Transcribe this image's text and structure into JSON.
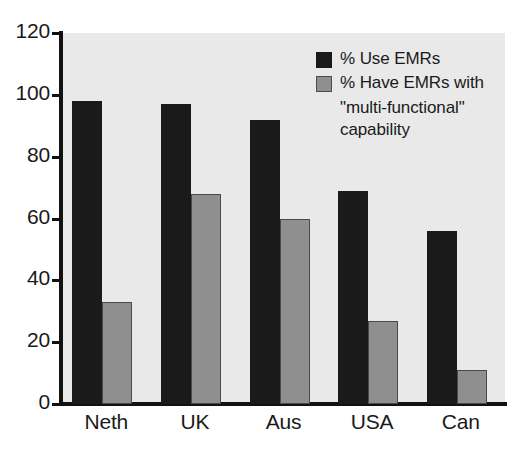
{
  "chart_data": {
    "type": "bar",
    "title": "",
    "subtitle": "",
    "xlabel": "",
    "ylabel": "",
    "categories": [
      "Neth",
      "UK",
      "Aus",
      "USA",
      "Can"
    ],
    "series": [
      {
        "name": "% Use EMRs",
        "color": "#1a1a1a",
        "values": [
          98,
          97,
          92,
          69,
          56
        ]
      },
      {
        "name": "% Have EMRs with \"multi-functional\" capability",
        "color": "#8f8f8f",
        "values": [
          33,
          68,
          60,
          27,
          11
        ]
      }
    ],
    "ylim": [
      0,
      120
    ],
    "yticks": [
      0,
      20,
      40,
      60,
      80,
      100,
      120
    ],
    "ytick_labels": [
      "0",
      "20",
      "40",
      "60",
      "80",
      "100",
      "120"
    ],
    "grid": false,
    "legend_position": "top-right"
  },
  "legend": {
    "entries": [
      {
        "swatch": "black-square",
        "line1": "% Use EMRs",
        "line2": "",
        "line3": ""
      },
      {
        "swatch": "gray-square",
        "line1": "% Have EMRs with",
        "line2": "\"multi-functional\"",
        "line3": "capability"
      }
    ]
  },
  "colors": {
    "plot_background": "#e9e9e9",
    "axis": "#111111",
    "series_dark": "#1a1a1a",
    "series_light": "#8f8f8f",
    "text": "#1a1a1a"
  }
}
